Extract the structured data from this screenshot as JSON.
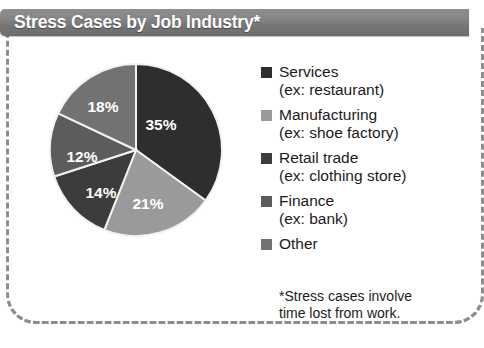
{
  "header": {
    "title": "Stress Cases by Job Industry*",
    "background_color": "#7d7d7d",
    "text_color": "#ffffff"
  },
  "frame": {
    "border_style": "dashed",
    "border_color": "#8d8d8d"
  },
  "chart_data": {
    "type": "pie",
    "title": "Stress Cases by Job Industry*",
    "categories": [
      "Services",
      "Manufacturing",
      "Retail trade",
      "Finance",
      "Other"
    ],
    "values": [
      35,
      21,
      14,
      12,
      18
    ],
    "labels": [
      "35%",
      "21%",
      "14%",
      "12%",
      "18%"
    ],
    "colors": [
      "#2e2e2e",
      "#9a9a9a",
      "#3c3c3c",
      "#5c5c5c",
      "#727272"
    ],
    "start_angle_deg": 0,
    "direction": "clockwise",
    "legend_position": "right",
    "grid": false,
    "units": "percent"
  },
  "pie": {
    "slices": [
      {
        "label": "35%",
        "value": 35,
        "color": "#2e2e2e",
        "label_x": 113,
        "label_y": 64
      },
      {
        "label": "21%",
        "value": 21,
        "color": "#9a9a9a",
        "label_x": 100,
        "label_y": 143
      },
      {
        "label": "14%",
        "value": 14,
        "color": "#3c3c3c",
        "label_x": 53,
        "label_y": 132
      },
      {
        "label": "12%",
        "value": 12,
        "color": "#5c5c5c",
        "label_x": 34,
        "label_y": 96
      },
      {
        "label": "18%",
        "value": 18,
        "color": "#727272",
        "label_x": 55,
        "label_y": 46
      }
    ]
  },
  "legend": {
    "items": [
      {
        "label": "Services",
        "sub": "(ex: restaurant)",
        "color": "#2e2e2e"
      },
      {
        "label": "Manufacturing",
        "sub": "(ex: shoe factory)",
        "color": "#9a9a9a"
      },
      {
        "label": "Retail trade",
        "sub": "(ex: clothing store)",
        "color": "#3c3c3c"
      },
      {
        "label": "Finance",
        "sub": "(ex: bank)",
        "color": "#5c5c5c"
      },
      {
        "label": "Other",
        "sub": "",
        "color": "#727272"
      }
    ]
  },
  "footnote": {
    "line1": "*Stress cases involve",
    "line2": "time lost from work."
  }
}
